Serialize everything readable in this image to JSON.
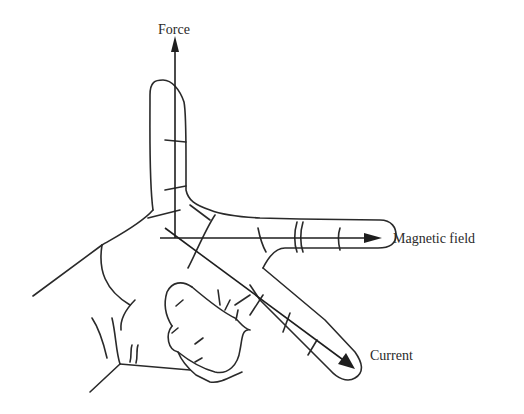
{
  "diagram": {
    "labels": {
      "force": "Force",
      "magnetic_field": "Magnetic field",
      "current": "Current"
    },
    "colors": {
      "background": "#ffffff",
      "ink": "#2a2a2a"
    },
    "axes": [
      {
        "name": "Force",
        "direction": "up",
        "finger": "thumb"
      },
      {
        "name": "Magnetic field",
        "direction": "right",
        "finger": "first finger"
      },
      {
        "name": "Current",
        "direction": "down-right",
        "finger": "second finger"
      }
    ]
  }
}
